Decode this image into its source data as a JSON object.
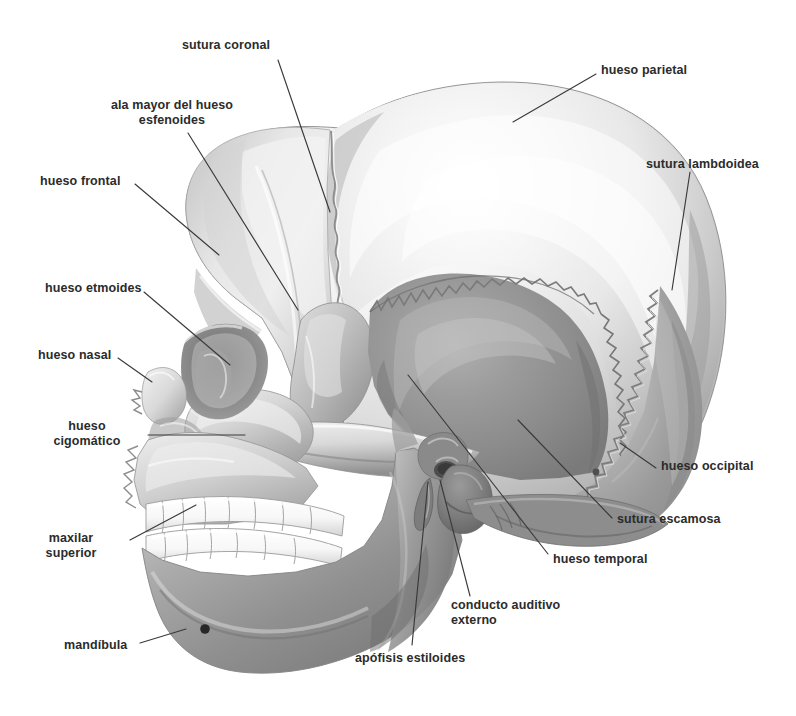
{
  "figure": {
    "language": "es",
    "view": "lateral",
    "style": "grayscale-airbrush-illustration",
    "background_color": "#ffffff",
    "text_color": "#2b2b2b",
    "leader_line_color": "#3a3a3a",
    "width": 796,
    "height": 716
  },
  "palette": {
    "bone_highlight": "#f4f4f4",
    "bone_light": "#e2e2e2",
    "bone_mid": "#c4c4c4",
    "bone_shadow": "#9a9a9a",
    "temporal_gray": "#8a8a8a",
    "deep_shadow": "#5a5a5a",
    "tooth_white": "#fbfbfb",
    "outline": "#6b6b6b"
  },
  "labels": [
    {
      "id": "sutura-coronal",
      "text": "sutura coronal",
      "align": "center",
      "x": 226,
      "y": 38,
      "leader": [
        [
          278,
          60
        ],
        [
          330,
          212
        ]
      ]
    },
    {
      "id": "ala-mayor-esfenoides",
      "text": "ala mayor del hueso\nesfenoides",
      "align": "center",
      "x": 172,
      "y": 98,
      "leader": [
        [
          188,
          133
        ],
        [
          298,
          310
        ]
      ]
    },
    {
      "id": "hueso-parietal",
      "text": "hueso parietal",
      "align": "left",
      "x": 601,
      "y": 63,
      "leader": [
        [
          596,
          74
        ],
        [
          513,
          122
        ]
      ]
    },
    {
      "id": "hueso-frontal",
      "text": "hueso frontal",
      "align": "left",
      "x": 40,
      "y": 174,
      "leader": [
        [
          135,
          184
        ],
        [
          219,
          255
        ]
      ]
    },
    {
      "id": "sutura-lambdoidea",
      "text": "sutura lambdoidea",
      "align": "left",
      "x": 646,
      "y": 157,
      "leader": [
        [
          690,
          172
        ],
        [
          672,
          290
        ]
      ]
    },
    {
      "id": "hueso-etmoides",
      "text": "hueso etmoides",
      "align": "left",
      "x": 45,
      "y": 281,
      "leader": [
        [
          144,
          292
        ],
        [
          230,
          365
        ]
      ]
    },
    {
      "id": "hueso-nasal",
      "text": "hueso nasal",
      "align": "left",
      "x": 38,
      "y": 348,
      "leader": [
        [
          118,
          358
        ],
        [
          152,
          382
        ]
      ]
    },
    {
      "id": "hueso-cigomatico",
      "text": "hueso\ncigomático",
      "align": "center",
      "x": 72,
      "y": 419,
      "leader": [
        [
          148,
          435
        ],
        [
          245,
          435
        ]
      ]
    },
    {
      "id": "hueso-occipital",
      "text": "hueso occipital",
      "align": "left",
      "x": 661,
      "y": 459,
      "leader": [
        [
          656,
          468
        ],
        [
          620,
          443
        ]
      ]
    },
    {
      "id": "sutura-escamosa",
      "text": "sutura escamosa",
      "align": "left",
      "x": 617,
      "y": 512,
      "leader": [
        [
          612,
          518
        ],
        [
          518,
          420
        ]
      ]
    },
    {
      "id": "maxilar-superior",
      "text": "maxilar\nsuperior",
      "align": "center",
      "x": 63,
      "y": 531,
      "leader": [
        [
          130,
          540
        ],
        [
          196,
          505
        ]
      ]
    },
    {
      "id": "hueso-temporal",
      "text": "hueso temporal",
      "align": "left",
      "x": 553,
      "y": 552,
      "leader": [
        [
          548,
          554
        ],
        [
          408,
          375
        ]
      ]
    },
    {
      "id": "conducto-auditivo-externo",
      "text": "conducto auditivo\nexterno",
      "align": "left",
      "x": 451,
      "y": 598,
      "leader": [
        [
          470,
          596
        ],
        [
          440,
          480
        ]
      ]
    },
    {
      "id": "mandibula",
      "text": "mandíbula",
      "align": "left",
      "x": 64,
      "y": 638,
      "leader": [
        [
          140,
          643
        ],
        [
          186,
          629
        ]
      ]
    },
    {
      "id": "apofisis-estiloides",
      "text": "apófisis estiloides",
      "align": "left",
      "x": 355,
      "y": 651,
      "leader": [
        [
          412,
          645
        ],
        [
          428,
          482
        ]
      ]
    }
  ]
}
